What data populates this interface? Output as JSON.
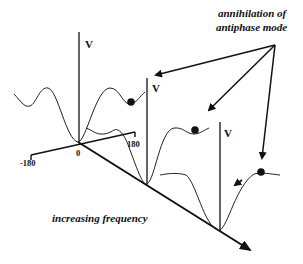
{
  "annotation": {
    "line1": "annihilation of",
    "line2": "antiphase mode"
  },
  "axes": {
    "phase_min_label": "-180",
    "phase_zero_label": "0",
    "phase_max_label": "180",
    "v_label_1": "V",
    "v_label_2": "V",
    "v_label_3": "V",
    "frequency_label": "increasing frequency"
  },
  "colors": {
    "ink": "#111111",
    "background": "#ffffff"
  }
}
